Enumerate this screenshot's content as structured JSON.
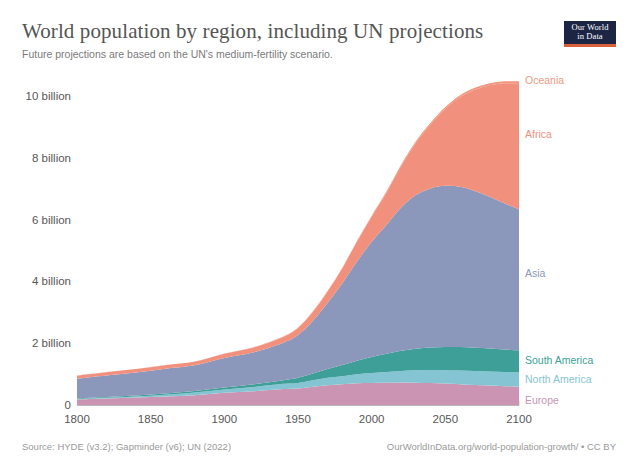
{
  "header": {
    "title": "World population by region, including UN projections",
    "subtitle": "Future projections are based on the UN's medium-fertility scenario."
  },
  "logo": {
    "line1": "Our World",
    "line2": "in Data"
  },
  "footer": {
    "source": "Source: HYDE (v3.2); Gapminder (v6); UN (2022)",
    "url": "OurWorldInData.org/world-population-growth/ • CC BY"
  },
  "colors": {
    "oceania": "#f2977f",
    "africa": "#f2907e",
    "asia": "#8b97bb",
    "south_america": "#3d9f97",
    "north_america": "#85c5d3",
    "europe": "#cb94b3",
    "axis_text": "#575757",
    "title_text": "#555555",
    "subtitle_text": "#7a7a7a",
    "footer_text": "#9a9a9a",
    "grid": "#dcdcdc",
    "logo_bg": "#1d2545",
    "logo_accent": "#d9603b"
  },
  "chart_data": {
    "type": "area",
    "stacked": true,
    "title": "World population by region, including UN projections",
    "subtitle": "Future projections are based on the UN's medium-fertility scenario.",
    "xlabel": "",
    "ylabel": "",
    "xlim": [
      1800,
      2100
    ],
    "ylim": [
      0,
      11.2
    ],
    "y_unit": "billion people",
    "grid": false,
    "legend": "inline-right-labels",
    "xticks": [
      1800,
      1850,
      1900,
      1950,
      2000,
      2050,
      2100
    ],
    "xtick_labels": [
      "1800",
      "1850",
      "1900",
      "1950",
      "2000",
      "2050",
      "2100"
    ],
    "yticks": [
      0,
      2,
      4,
      6,
      8,
      10
    ],
    "ytick_labels": [
      "0",
      "2 billion",
      "4 billion",
      "6 billion",
      "8 billion",
      "10 billion"
    ],
    "x": [
      1800,
      1820,
      1840,
      1860,
      1880,
      1900,
      1920,
      1940,
      1950,
      1960,
      1970,
      1980,
      1990,
      2000,
      2010,
      2020,
      2030,
      2040,
      2050,
      2060,
      2070,
      2080,
      2090,
      2100
    ],
    "stack_order_bottom_to_top": [
      "Europe",
      "North America",
      "South America",
      "Asia",
      "Africa",
      "Oceania"
    ],
    "series": [
      {
        "name": "Europe",
        "color": "#cb94b3",
        "label_y_billion": 0.18,
        "values": [
          0.195,
          0.225,
          0.255,
          0.29,
          0.33,
          0.41,
          0.46,
          0.53,
          0.55,
          0.605,
          0.655,
          0.69,
          0.72,
          0.73,
          0.735,
          0.745,
          0.74,
          0.73,
          0.71,
          0.69,
          0.665,
          0.645,
          0.625,
          0.61
        ]
      },
      {
        "name": "North America",
        "color": "#85c5d3",
        "label_y_billion": 0.86,
        "values": [
          0.017,
          0.024,
          0.04,
          0.06,
          0.09,
          0.11,
          0.14,
          0.17,
          0.18,
          0.21,
          0.24,
          0.26,
          0.29,
          0.32,
          0.35,
          0.375,
          0.4,
          0.415,
          0.43,
          0.44,
          0.45,
          0.455,
          0.46,
          0.465
        ]
      },
      {
        "name": "South America",
        "color": "#3d9f97",
        "label_y_billion": 1.47,
        "values": [
          0.022,
          0.025,
          0.03,
          0.04,
          0.05,
          0.065,
          0.09,
          0.12,
          0.17,
          0.22,
          0.29,
          0.36,
          0.44,
          0.52,
          0.59,
          0.65,
          0.7,
          0.73,
          0.75,
          0.76,
          0.755,
          0.745,
          0.73,
          0.71
        ]
      },
      {
        "name": "Asia",
        "color": "#8b97bb",
        "label_y_billion": 4.3,
        "values": [
          0.635,
          0.7,
          0.745,
          0.8,
          0.83,
          0.95,
          1.03,
          1.21,
          1.38,
          1.7,
          2.13,
          2.64,
          3.21,
          3.73,
          4.17,
          4.64,
          4.97,
          5.15,
          5.22,
          5.19,
          5.07,
          4.91,
          4.73,
          4.56
        ]
      },
      {
        "name": "Africa",
        "color": "#f2907e",
        "label_y_billion": 8.8,
        "values": [
          0.1,
          0.105,
          0.11,
          0.115,
          0.12,
          0.14,
          0.16,
          0.19,
          0.23,
          0.29,
          0.37,
          0.48,
          0.64,
          0.81,
          1.04,
          1.34,
          1.69,
          2.07,
          2.49,
          2.9,
          3.28,
          3.61,
          3.88,
          4.08
        ]
      },
      {
        "name": "Oceania",
        "color": "#f2977f",
        "label_y_billion": 10.55,
        "values": [
          0.002,
          0.002,
          0.002,
          0.003,
          0.004,
          0.006,
          0.008,
          0.011,
          0.013,
          0.016,
          0.02,
          0.023,
          0.027,
          0.031,
          0.037,
          0.043,
          0.048,
          0.053,
          0.057,
          0.06,
          0.063,
          0.065,
          0.067,
          0.069
        ]
      }
    ],
    "totals_billion": [
      0.971,
      1.081,
      1.182,
      1.308,
      1.424,
      1.681,
      1.888,
      2.231,
      2.523,
      3.041,
      3.705,
      4.453,
      5.327,
      6.141,
      6.922,
      7.793,
      8.548,
      9.148,
      9.657,
      10.04,
      10.283,
      10.431,
      10.492,
      10.494
    ],
    "annotations": [
      "Oceania",
      "Africa",
      "Asia",
      "South America",
      "North America",
      "Europe"
    ]
  }
}
